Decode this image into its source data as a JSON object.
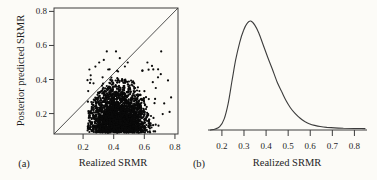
{
  "figure": {
    "background": "#fcfbf7",
    "ink_color": "#262626",
    "line_color": "#3c3c3c",
    "point_color": "#0a0a0a"
  },
  "labels": {
    "panel_a": "(a)",
    "panel_b": "(b)",
    "panel_a_xlabel": "Realized SRMR",
    "panel_a_ylabel": "Posterior predicted SRMR",
    "panel_b_xlabel": "Realized SRMR"
  },
  "chart_data": [
    {
      "panel": "a",
      "type": "scatter",
      "xlabel": "Realized SRMR",
      "ylabel": "Posterior predicted SRMR",
      "xticks": [
        0.2,
        0.4,
        0.6,
        0.8
      ],
      "yticks": [
        0.2,
        0.4,
        0.6,
        0.8
      ],
      "xlim": [
        0.01,
        0.82
      ],
      "ylim": [
        0.08,
        0.82
      ],
      "grid": false,
      "reference_line": {
        "identity_y_equals_x": true
      },
      "cloud": {
        "n": 2600,
        "cx": 0.435,
        "sx": 0.1,
        "y0": 0.088,
        "sy": 0.135,
        "rx": 0.205,
        "ry": 0.335,
        "xmin": 0.226
      },
      "fringe": {
        "n": 240,
        "cx": 0.435,
        "sx": 0.125,
        "y0": 0.088,
        "sy": 0.17,
        "ymax": 0.5,
        "xmin": 0.228,
        "xmax": 0.72
      },
      "outliers": [
        [
          0.355,
          0.565
        ],
        [
          0.415,
          0.565
        ],
        [
          0.44,
          0.525
        ],
        [
          0.71,
          0.565
        ],
        [
          0.755,
          0.395
        ],
        [
          0.775,
          0.295
        ],
        [
          0.765,
          0.21
        ],
        [
          0.73,
          0.26
        ],
        [
          0.69,
          0.46
        ],
        [
          0.65,
          0.48
        ],
        [
          0.62,
          0.5
        ],
        [
          0.305,
          0.5
        ],
        [
          0.335,
          0.515
        ],
        [
          0.25,
          0.425
        ],
        [
          0.675,
          0.35
        ],
        [
          0.245,
          0.38
        ]
      ]
    },
    {
      "panel": "b",
      "type": "line",
      "xlabel": "Realized SRMR",
      "xticks": [
        0.2,
        0.3,
        0.4,
        0.5,
        0.6,
        0.7,
        0.8
      ],
      "xlim": [
        0.137,
        0.857
      ],
      "grid": false,
      "peak_x": 0.33,
      "curve_points": [
        [
          0.148,
          0.0
        ],
        [
          0.17,
          0.01
        ],
        [
          0.19,
          0.03
        ],
        [
          0.21,
          0.1
        ],
        [
          0.228,
          0.24
        ],
        [
          0.245,
          0.44
        ],
        [
          0.262,
          0.64
        ],
        [
          0.28,
          0.8
        ],
        [
          0.298,
          0.915
        ],
        [
          0.315,
          0.98
        ],
        [
          0.331,
          1.0
        ],
        [
          0.349,
          0.962
        ],
        [
          0.367,
          0.89
        ],
        [
          0.388,
          0.775
        ],
        [
          0.408,
          0.665
        ],
        [
          0.428,
          0.56
        ],
        [
          0.45,
          0.44
        ],
        [
          0.47,
          0.355
        ],
        [
          0.49,
          0.27
        ],
        [
          0.51,
          0.205
        ],
        [
          0.53,
          0.155
        ],
        [
          0.553,
          0.11
        ],
        [
          0.575,
          0.078
        ],
        [
          0.598,
          0.055
        ],
        [
          0.62,
          0.042
        ],
        [
          0.645,
          0.032
        ],
        [
          0.675,
          0.024
        ],
        [
          0.71,
          0.019
        ],
        [
          0.75,
          0.016
        ],
        [
          0.8,
          0.014
        ],
        [
          0.848,
          0.013
        ]
      ]
    }
  ]
}
